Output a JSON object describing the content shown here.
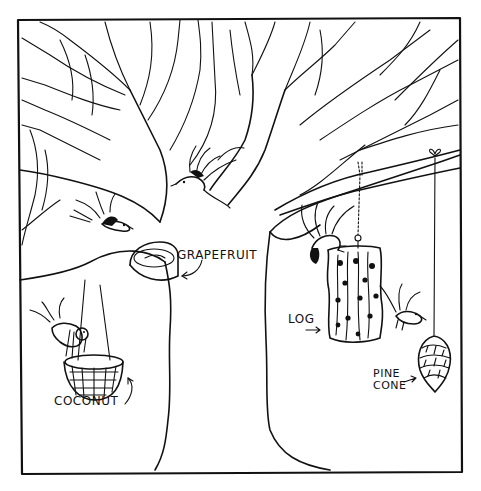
{
  "illustration": {
    "subject": "bare tree with bird feeders and birds",
    "style": "black ink line drawing on white",
    "colors": {
      "ink": "#111111",
      "background": "#ffffff"
    },
    "frame": {
      "left": 18,
      "top": 19,
      "right": 462,
      "bottom": 472
    }
  },
  "labels": {
    "grapefruit": "GRAPEFRUIT",
    "coconut": "COCONUT",
    "log": "LOG",
    "pine_cone_line1": "PINE",
    "pine_cone_line2": "CONE"
  },
  "feeders": [
    {
      "name": "grapefruit",
      "label": "GRAPEFRUIT",
      "hung_from": "left branch fork"
    },
    {
      "name": "coconut",
      "label": "COCONUT",
      "hung_from": "left branch by strings"
    },
    {
      "name": "log",
      "label": "LOG",
      "hung_from": "right branch by chain"
    },
    {
      "name": "pine-cone",
      "label": "PINE CONE",
      "hung_from": "right branch by string"
    }
  ],
  "birds": [
    {
      "position": "center canopy, flying"
    },
    {
      "position": "upper left, flying"
    },
    {
      "position": "left, perched on coconut"
    },
    {
      "position": "right, clinging to log top"
    },
    {
      "position": "right, near pine cone"
    }
  ]
}
